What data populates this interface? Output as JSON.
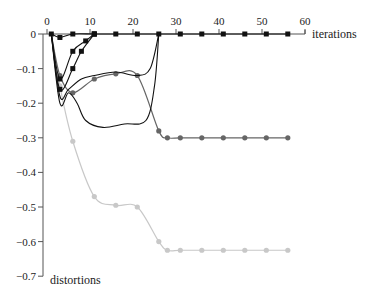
{
  "chart_data": {
    "type": "line",
    "title": "",
    "xlabel": "iterations",
    "ylabel": "distortions",
    "xlim": [
      0,
      60
    ],
    "ylim": [
      -0.7,
      0
    ],
    "grid": false,
    "legend": null,
    "x_ticks": [
      "0",
      "10",
      "20",
      "30",
      "40",
      "50",
      "60"
    ],
    "y_ticks": [
      "0",
      "-0.1",
      "-0.2",
      "-0.3",
      "-0.4",
      "-0.5",
      "-0.6",
      "-0.7"
    ],
    "series": [
      {
        "name": "series-black-1",
        "color": "#111111",
        "marker": "square",
        "x": [
          1,
          3,
          6,
          11,
          16,
          21,
          26,
          31,
          36,
          41,
          46,
          51,
          56
        ],
        "y": [
          0,
          -0.01,
          0,
          0,
          0,
          0,
          0,
          0,
          0,
          0,
          0,
          0,
          0
        ]
      },
      {
        "name": "series-black-2",
        "color": "#111111",
        "marker": "square",
        "x": [
          1,
          3,
          6,
          8,
          11
        ],
        "y": [
          0,
          -0.16,
          -0.1,
          -0.05,
          0
        ]
      },
      {
        "name": "series-black-3",
        "color": "#111111",
        "marker": "square",
        "x": [
          1,
          3,
          6,
          9,
          11
        ],
        "y": [
          0,
          -0.13,
          -0.05,
          -0.02,
          0
        ]
      },
      {
        "name": "series-black-4",
        "color": "#111111",
        "marker": "none",
        "x": [
          1,
          3,
          5,
          8,
          11,
          16,
          21,
          24,
          26
        ],
        "y": [
          0,
          -0.18,
          -0.16,
          -0.13,
          -0.12,
          -0.11,
          -0.12,
          -0.1,
          0
        ]
      },
      {
        "name": "series-black-5",
        "color": "#111111",
        "marker": "none",
        "x": [
          1,
          3,
          5,
          7,
          9,
          13,
          18,
          23,
          25,
          26
        ],
        "y": [
          0,
          -0.2,
          -0.17,
          -0.2,
          -0.25,
          -0.27,
          -0.26,
          -0.25,
          -0.15,
          0
        ]
      },
      {
        "name": "series-darkgray",
        "color": "#666666",
        "marker": "circle",
        "x": [
          1,
          3,
          6,
          11,
          16,
          21,
          26,
          28,
          31,
          36,
          41,
          46,
          51,
          56
        ],
        "y": [
          0,
          -0.12,
          -0.17,
          -0.13,
          -0.115,
          -0.12,
          -0.28,
          -0.3,
          -0.3,
          -0.3,
          -0.3,
          -0.3,
          -0.3,
          -0.3
        ]
      },
      {
        "name": "series-lightgray",
        "color": "#c8c8c8",
        "marker": "circle",
        "x": [
          1,
          3,
          6,
          11,
          16,
          21,
          26,
          28,
          31,
          36,
          41,
          46,
          51,
          56
        ],
        "y": [
          0,
          -0.15,
          -0.31,
          -0.47,
          -0.495,
          -0.5,
          -0.6,
          -0.625,
          -0.625,
          -0.625,
          -0.625,
          -0.625,
          -0.625,
          -0.625
        ]
      }
    ]
  },
  "axes": {
    "x_title": "iterations",
    "y_title": "distortions"
  }
}
